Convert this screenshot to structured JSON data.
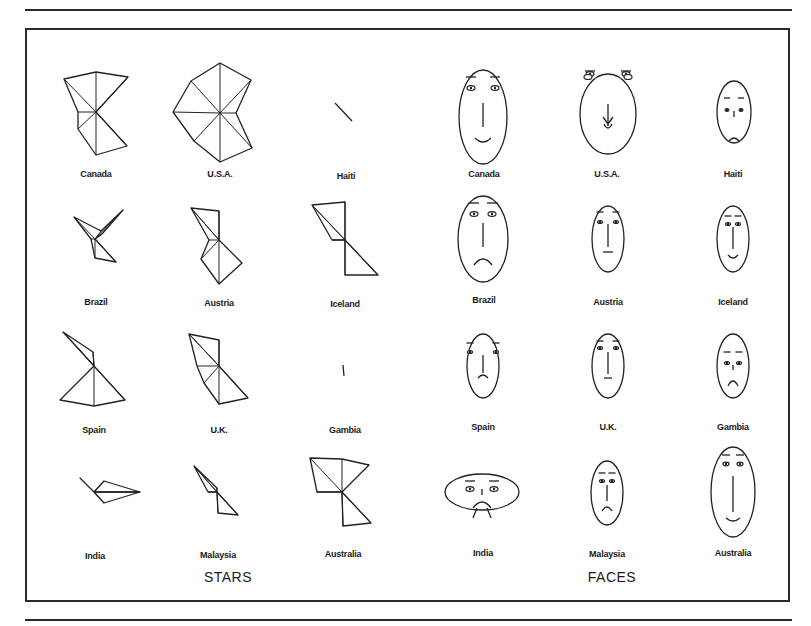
{
  "figure": {
    "sections": [
      {
        "title": "STARS",
        "x": 228,
        "y": 570
      },
      {
        "title": "FACES",
        "x": 612,
        "y": 570
      }
    ],
    "countries": [
      "Canada",
      "U.S.A.",
      "Haiti",
      "Brazil",
      "Austria",
      "Iceland",
      "Spain",
      "U.K.",
      "Gambia",
      "India",
      "Malaysia",
      "Australia"
    ],
    "stars": [
      {
        "country": "Canada",
        "label_x": 96,
        "label_y": 175,
        "cx": 96,
        "cy": 112,
        "points": [
          [
            96,
            72
          ],
          [
            128,
            77
          ],
          [
            96,
            112
          ],
          [
            127,
            146
          ],
          [
            96,
            155
          ],
          [
            78,
            129
          ],
          [
            78,
            112
          ],
          [
            64,
            79
          ]
        ]
      },
      {
        "country": "U.S.A.",
        "label_x": 220,
        "label_y": 175,
        "cx": 220,
        "cy": 113,
        "points": [
          [
            220,
            63
          ],
          [
            251,
            80
          ],
          [
            236,
            113
          ],
          [
            252,
            148
          ],
          [
            220,
            162
          ],
          [
            194,
            141
          ],
          [
            173,
            112
          ],
          [
            191,
            81
          ]
        ]
      },
      {
        "country": "Haiti",
        "label_x": 346,
        "label_y": 177,
        "cx": 345,
        "cy": 111,
        "points": [
          [
            335,
            103
          ],
          [
            352,
            121
          ]
        ]
      },
      {
        "country": "Brazil",
        "label_x": 96,
        "label_y": 303,
        "cx": 95,
        "cy": 239,
        "points": [
          [
            123,
            210
          ],
          [
            102,
            234
          ],
          [
            95,
            239
          ],
          [
            116,
            262
          ],
          [
            95,
            258
          ],
          [
            91,
            239
          ],
          [
            74,
            217
          ],
          [
            101,
            231
          ]
        ]
      },
      {
        "country": "Austria",
        "label_x": 219,
        "label_y": 304,
        "cx": 219,
        "cy": 240,
        "points": [
          [
            191,
            208
          ],
          [
            219,
            211
          ],
          [
            219,
            240
          ],
          [
            242,
            263
          ],
          [
            219,
            284
          ],
          [
            201,
            259
          ],
          [
            209,
            240
          ],
          [
            191,
            208
          ]
        ]
      },
      {
        "country": "Iceland",
        "label_x": 345,
        "label_y": 305,
        "cx": 345,
        "cy": 240,
        "points": [
          [
            312,
            205
          ],
          [
            345,
            202
          ],
          [
            345,
            240
          ],
          [
            378,
            275
          ],
          [
            345,
            275
          ],
          [
            345,
            240
          ],
          [
            332,
            240
          ],
          [
            312,
            205
          ]
        ]
      },
      {
        "country": "Spain",
        "label_x": 94,
        "label_y": 431,
        "cx": 94,
        "cy": 366,
        "points": [
          [
            63,
            332
          ],
          [
            93,
            352
          ],
          [
            94,
            366
          ],
          [
            125,
            400
          ],
          [
            94,
            406
          ],
          [
            60,
            400
          ],
          [
            94,
            366
          ],
          [
            75,
            345
          ]
        ]
      },
      {
        "country": "U.K.",
        "label_x": 219,
        "label_y": 431,
        "cx": 219,
        "cy": 366,
        "points": [
          [
            189,
            334
          ],
          [
            219,
            340
          ],
          [
            219,
            366
          ],
          [
            248,
            398
          ],
          [
            219,
            404
          ],
          [
            204,
            383
          ],
          [
            197,
            366
          ],
          [
            189,
            334
          ]
        ]
      },
      {
        "country": "Gambia",
        "label_x": 345,
        "label_y": 431,
        "cx": 344,
        "cy": 370,
        "points": [
          [
            343,
            365
          ],
          [
            344,
            376
          ]
        ]
      },
      {
        "country": "India",
        "label_x": 95,
        "label_y": 557,
        "cx": 94,
        "cy": 492,
        "points": [
          [
            80,
            478
          ],
          [
            94,
            492
          ],
          [
            104,
            481
          ],
          [
            140,
            492
          ],
          [
            104,
            503
          ],
          [
            94,
            492
          ],
          [
            140,
            492
          ],
          [
            94,
            492
          ]
        ]
      },
      {
        "country": "Malaysia",
        "label_x": 218,
        "label_y": 556,
        "cx": 217,
        "cy": 492,
        "points": [
          [
            194,
            466
          ],
          [
            217,
            488
          ],
          [
            217,
            492
          ],
          [
            238,
            515
          ],
          [
            218,
            513
          ],
          [
            217,
            492
          ],
          [
            208,
            492
          ],
          [
            194,
            466
          ]
        ]
      },
      {
        "country": "Australia",
        "label_x": 343,
        "label_y": 555,
        "cx": 342,
        "cy": 492,
        "points": [
          [
            310,
            458
          ],
          [
            342,
            459
          ],
          [
            369,
            465
          ],
          [
            342,
            492
          ],
          [
            371,
            523
          ],
          [
            343,
            526
          ],
          [
            342,
            492
          ],
          [
            317,
            492
          ]
        ]
      }
    ],
    "faces": [
      {
        "country": "Canada",
        "label_x": 484,
        "label_y": 175,
        "cx": 483,
        "cy": 117,
        "rx": 24,
        "ry": 47,
        "eye_dy": -29,
        "eye_dx": 12,
        "eye_w": 4,
        "brow_dy": -40,
        "nose": [
          -14,
          10
        ],
        "mouth": {
          "dy": 21,
          "w": 8,
          "curve": 4
        }
      },
      {
        "country": "U.S.A.",
        "label_x": 607,
        "label_y": 175,
        "cx": 608,
        "cy": 114,
        "rx": 28,
        "ry": 40,
        "eye_dy": -40,
        "eye_dx": 18,
        "eye_w": 4,
        "brow_dy": -43,
        "nose": [
          -10,
          12
        ],
        "mouth": {
          "dy": 10,
          "w": 4,
          "curve": 4
        },
        "ears": true
      },
      {
        "country": "Haiti",
        "label_x": 733,
        "label_y": 175,
        "cx": 734,
        "cy": 112,
        "rx": 17,
        "ry": 31,
        "eye_dy": -2,
        "eye_dx": 7,
        "eye_w": 2,
        "brow_dy": -14,
        "nose": [
          -1,
          5
        ],
        "mouth": {
          "dy": 29,
          "w": 5,
          "curve": -3
        }
      },
      {
        "country": "Brazil",
        "label_x": 484,
        "label_y": 301,
        "cx": 483,
        "cy": 239,
        "rx": 25,
        "ry": 43,
        "eye_dy": -25,
        "eye_dx": 9,
        "eye_w": 4,
        "brow_dy": -36,
        "nose": [
          -16,
          8
        ],
        "mouth": {
          "dy": 26,
          "w": 9,
          "curve": -6
        }
      },
      {
        "country": "Austria",
        "label_x": 608,
        "label_y": 303,
        "cx": 608,
        "cy": 239,
        "rx": 16,
        "ry": 33,
        "eye_dy": -17,
        "eye_dx": 8,
        "eye_w": 2.5,
        "brow_dy": -27,
        "nose": [
          -15,
          8
        ],
        "mouth": {
          "dy": 13,
          "w": 5,
          "curve": 0
        }
      },
      {
        "country": "Iceland",
        "label_x": 733,
        "label_y": 303,
        "cx": 733,
        "cy": 239,
        "rx": 16,
        "ry": 33,
        "eye_dy": -15,
        "eye_dx": 5,
        "eye_w": 2.5,
        "brow_dy": -23,
        "nose": [
          -12,
          10
        ],
        "mouth": {
          "dy": 16,
          "w": 5,
          "curve": 3
        }
      },
      {
        "country": "Spain",
        "label_x": 483,
        "label_y": 428,
        "cx": 483,
        "cy": 366,
        "rx": 16,
        "ry": 32,
        "eye_dy": -14,
        "eye_dx": 13,
        "eye_w": 2.5,
        "brow_dy": -23,
        "nose": [
          -11,
          7
        ],
        "mouth": {
          "dy": 12,
          "w": 5,
          "curve": -3
        }
      },
      {
        "country": "U.K.",
        "label_x": 608,
        "label_y": 428,
        "cx": 608,
        "cy": 366,
        "rx": 16,
        "ry": 32,
        "eye_dy": -18,
        "eye_dx": 8,
        "eye_w": 2.5,
        "brow_dy": -25,
        "nose": [
          -14,
          8
        ],
        "mouth": {
          "dy": 12,
          "w": 4,
          "curve": 0
        }
      },
      {
        "country": "Gambia",
        "label_x": 733,
        "label_y": 428,
        "cx": 733,
        "cy": 366,
        "rx": 16,
        "ry": 32,
        "eye_dy": -3,
        "eye_dx": 6,
        "eye_w": 2.5,
        "brow_dy": -14,
        "nose": [
          -1,
          4
        ],
        "mouth": {
          "dy": 20,
          "w": 5,
          "curve": -5
        }
      },
      {
        "country": "India",
        "label_x": 483,
        "label_y": 554,
        "cx": 482,
        "cy": 492,
        "rx": 37,
        "ry": 18,
        "eye_dy": -3,
        "eye_dx": 12,
        "eye_w": 4,
        "brow_dy": -11,
        "nose": [
          -3,
          3
        ],
        "mouth": {
          "dy": 16,
          "w": 9,
          "curve": -6
        },
        "chin_legs": true
      },
      {
        "country": "Malaysia",
        "label_x": 607,
        "label_y": 555,
        "cx": 607,
        "cy": 493,
        "rx": 16,
        "ry": 32,
        "eye_dy": -12,
        "eye_dx": 5,
        "eye_w": 2.5,
        "brow_dy": -20,
        "nose": [
          -8,
          8
        ],
        "mouth": {
          "dy": 18,
          "w": 5,
          "curve": -4
        }
      },
      {
        "country": "Australia",
        "label_x": 733,
        "label_y": 554,
        "cx": 733,
        "cy": 492,
        "rx": 22,
        "ry": 45,
        "eye_dy": -28,
        "eye_dx": 7,
        "eye_w": 3,
        "brow_dy": -37,
        "nose": [
          -16,
          20
        ],
        "mouth": {
          "dy": 26,
          "w": 7,
          "curve": 3
        }
      }
    ]
  }
}
